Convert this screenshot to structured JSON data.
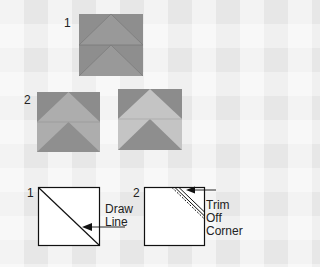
{
  "step1": {
    "label": "1"
  },
  "step2": {
    "label": "2"
  },
  "bottom": {
    "step1_label": "1",
    "step2_label": "2",
    "draw_line": [
      "Draw",
      "Line"
    ],
    "trim_corner": [
      "Trim",
      "Off",
      "Corner"
    ]
  },
  "colors": {
    "background": "#f1f1f1",
    "dark_gray": "#8a8a8a",
    "medium_gray": "#9d9d9d",
    "light_gray": "#b5b5b5",
    "lighter_gray": "#c4c4c4",
    "line": "#111111"
  }
}
